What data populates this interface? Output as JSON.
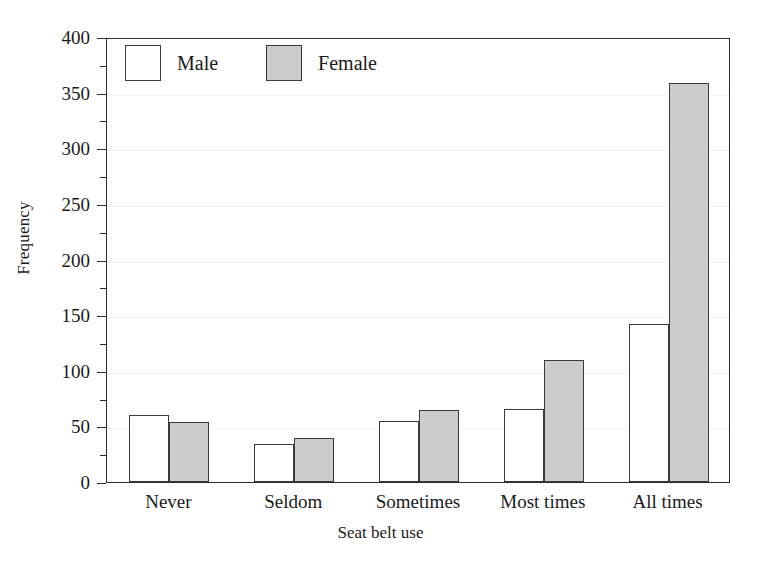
{
  "chart_data": {
    "type": "bar",
    "title": "",
    "xlabel": "Seat belt use",
    "ylabel": "Frequency",
    "categories": [
      "Never",
      "Seldom",
      "Sometimes",
      "Most times",
      "All times"
    ],
    "series": [
      {
        "name": "Male",
        "color": "#ffffff",
        "values": [
          60,
          34,
          55,
          66,
          142
        ]
      },
      {
        "name": "Female",
        "color": "#c9c9c9",
        "values": [
          54,
          40,
          65,
          110,
          359
        ]
      }
    ],
    "ylim": [
      0,
      400
    ],
    "ytick_labels": [
      "0",
      "50",
      "100",
      "150",
      "200",
      "250",
      "300",
      "350",
      "400"
    ],
    "ytick_values": [
      0,
      50,
      100,
      150,
      200,
      250,
      300,
      350,
      400
    ],
    "minor_tick_values": [
      25,
      75,
      125,
      175,
      225,
      275,
      325,
      375
    ],
    "grid": true,
    "legend_position": "top-left",
    "legend": [
      "Male",
      "Female"
    ]
  }
}
